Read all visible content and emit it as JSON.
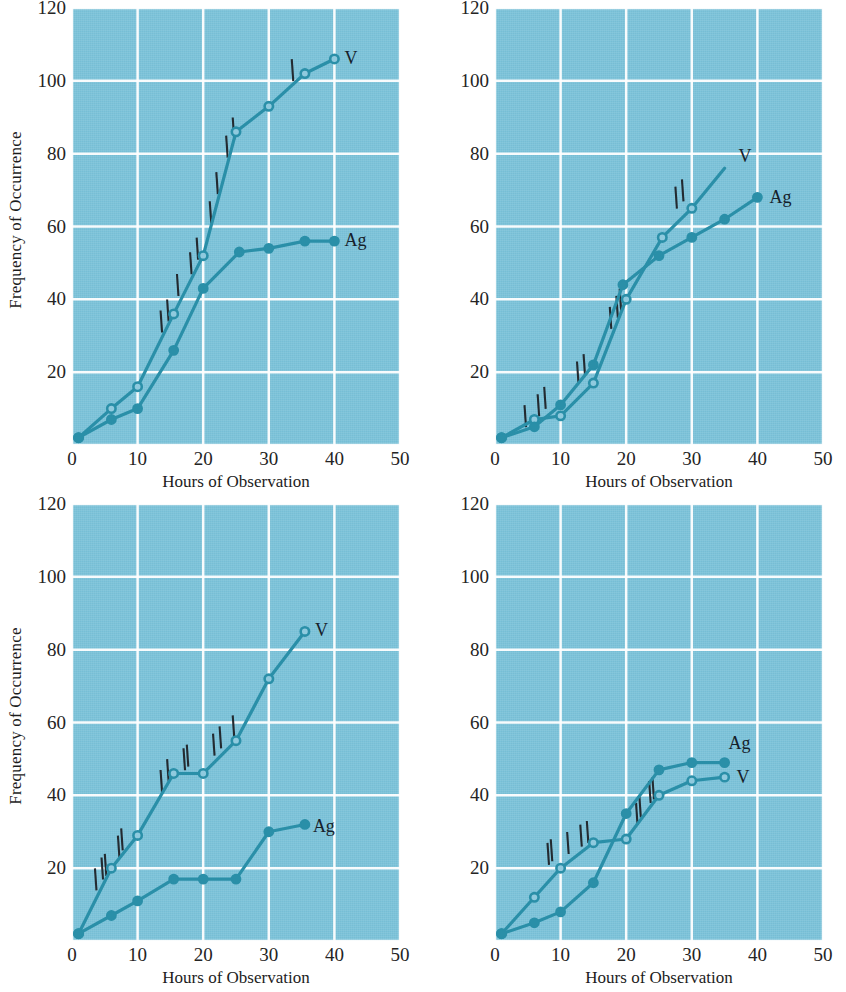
{
  "figure": {
    "background_color": "#7cc3da",
    "line_color": "#2a8fa8",
    "gridline_color": "#ffffff",
    "tickmark_color": "#232a30",
    "text_color": "#1c1c1c"
  },
  "axes": {
    "x_label": "Hours of Observation",
    "y_label": "Frequency of Occurrence",
    "x_ticks": [
      "0",
      "10",
      "20",
      "30",
      "40",
      "50"
    ],
    "y_ticks": [
      "0",
      "20",
      "40",
      "60",
      "80",
      "100",
      "120"
    ],
    "xlim": [
      0,
      50
    ],
    "ylim": [
      0,
      120
    ]
  },
  "series_labels": {
    "v": "V",
    "ag": "Ag"
  },
  "chart_data": [
    {
      "panel": 1,
      "position": "top-left",
      "type": "line",
      "title": "",
      "xlabel": "Hours of Observation",
      "ylabel": "Frequency of Occurrence",
      "xlim": [
        0,
        50
      ],
      "ylim": [
        0,
        120
      ],
      "grid": true,
      "legend": "inline-end-labels",
      "series": [
        {
          "name": "V",
          "marker": "open-circle",
          "points": [
            [
              1,
              2
            ],
            [
              6,
              10
            ],
            [
              10,
              16
            ],
            [
              15.5,
              36
            ],
            [
              20,
              52
            ],
            [
              25,
              86
            ],
            [
              30,
              93
            ],
            [
              35.5,
              102
            ],
            [
              40,
              106
            ]
          ]
        },
        {
          "name": "Ag",
          "marker": "filled-circle",
          "points": [
            [
              1,
              2
            ],
            [
              6,
              7
            ],
            [
              10,
              10
            ],
            [
              15.5,
              26
            ],
            [
              20,
              43
            ],
            [
              25.5,
              53
            ],
            [
              30,
              54
            ],
            [
              35.5,
              56
            ],
            [
              40,
              56
            ]
          ]
        }
      ],
      "tick_annotations": [
        [
          13.5,
          32
        ],
        [
          14.5,
          35
        ],
        [
          16,
          42
        ],
        [
          18,
          48
        ],
        [
          19,
          52
        ],
        [
          21,
          62
        ],
        [
          22,
          70
        ],
        [
          23.5,
          80
        ],
        [
          24.5,
          85
        ],
        [
          33.5,
          101
        ]
      ]
    },
    {
      "panel": 2,
      "position": "top-right",
      "type": "line",
      "title": "",
      "xlabel": "Hours of Observation",
      "ylabel": "",
      "xlim": [
        0,
        50
      ],
      "ylim": [
        0,
        120
      ],
      "grid": true,
      "legend": "inline-end-labels",
      "series": [
        {
          "name": "V",
          "marker": "open-circle",
          "points": [
            [
              1,
              2
            ],
            [
              6,
              7
            ],
            [
              10,
              8
            ],
            [
              15,
              17
            ],
            [
              20,
              40
            ],
            [
              25.5,
              57
            ],
            [
              30,
              65
            ],
            [
              35,
              76
            ]
          ]
        },
        {
          "name": "Ag",
          "marker": "filled-circle",
          "points": [
            [
              1,
              2
            ],
            [
              6,
              5
            ],
            [
              10,
              11
            ],
            [
              15,
              22
            ],
            [
              19.5,
              44
            ],
            [
              25,
              52
            ],
            [
              30,
              57
            ],
            [
              35,
              62
            ],
            [
              40,
              68
            ]
          ]
        }
      ],
      "tick_annotations": [
        [
          4.5,
          6
        ],
        [
          6.5,
          9
        ],
        [
          7.5,
          11
        ],
        [
          12.5,
          18
        ],
        [
          13.5,
          20
        ],
        [
          17.5,
          33
        ],
        [
          18.5,
          36
        ],
        [
          19,
          38
        ],
        [
          27.5,
          66
        ],
        [
          28.5,
          68
        ]
      ]
    },
    {
      "panel": 3,
      "position": "bottom-left",
      "type": "line",
      "title": "",
      "xlabel": "Hours of Observation",
      "ylabel": "Frequency of Occurrence",
      "xlim": [
        0,
        50
      ],
      "ylim": [
        0,
        120
      ],
      "grid": true,
      "legend": "inline-end-labels",
      "series": [
        {
          "name": "V",
          "marker": "open-circle",
          "points": [
            [
              1,
              2
            ],
            [
              6,
              20
            ],
            [
              10,
              29
            ],
            [
              15.5,
              46
            ],
            [
              20,
              46
            ],
            [
              25,
              55
            ],
            [
              30,
              72
            ],
            [
              35.5,
              85
            ]
          ]
        },
        {
          "name": "Ag",
          "marker": "filled-circle",
          "points": [
            [
              1,
              2
            ],
            [
              6,
              7
            ],
            [
              10,
              11
            ],
            [
              15.5,
              17
            ],
            [
              20,
              17
            ],
            [
              25,
              17
            ],
            [
              30,
              30
            ],
            [
              35.5,
              32
            ]
          ]
        }
      ],
      "tick_annotations": [
        [
          3.5,
          15
        ],
        [
          4.5,
          18
        ],
        [
          5,
          19
        ],
        [
          7,
          24
        ],
        [
          7.5,
          26
        ],
        [
          13.5,
          42
        ],
        [
          14.5,
          45
        ],
        [
          17,
          48
        ],
        [
          17.5,
          49
        ],
        [
          21.5,
          52
        ],
        [
          22.5,
          54
        ],
        [
          24.5,
          57
        ]
      ]
    },
    {
      "panel": 4,
      "position": "bottom-right",
      "type": "line",
      "title": "",
      "xlabel": "Hours of Observation",
      "ylabel": "",
      "xlim": [
        0,
        50
      ],
      "ylim": [
        0,
        120
      ],
      "grid": true,
      "legend": "inline-end-labels",
      "series": [
        {
          "name": "V",
          "marker": "open-circle",
          "points": [
            [
              1,
              2
            ],
            [
              6,
              12
            ],
            [
              10,
              20
            ],
            [
              15,
              27
            ],
            [
              20,
              28
            ],
            [
              25,
              40
            ],
            [
              30,
              44
            ],
            [
              35,
              45
            ]
          ]
        },
        {
          "name": "Ag",
          "marker": "filled-circle",
          "points": [
            [
              1,
              2
            ],
            [
              6,
              5
            ],
            [
              10,
              8
            ],
            [
              15,
              16
            ],
            [
              20,
              35
            ],
            [
              25,
              47
            ],
            [
              30,
              49
            ],
            [
              35,
              49
            ]
          ]
        }
      ],
      "tick_annotations": [
        [
          8,
          22
        ],
        [
          8.5,
          23
        ],
        [
          11,
          25
        ],
        [
          13,
          27
        ],
        [
          14,
          28
        ],
        [
          21.5,
          33
        ],
        [
          22,
          35
        ],
        [
          23.5,
          39
        ],
        [
          24,
          40
        ]
      ]
    }
  ]
}
